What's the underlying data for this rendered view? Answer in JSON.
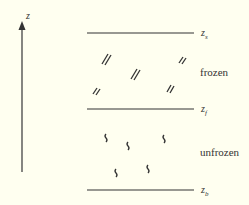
{
  "axis": {
    "label": "z"
  },
  "levels": [
    {
      "id": "zs",
      "label": "z",
      "sub": "s",
      "y": 33
    },
    {
      "id": "zf",
      "label": "z",
      "sub": "f",
      "y": 109
    },
    {
      "id": "zb",
      "label": "z",
      "sub": "b",
      "y": 190
    }
  ],
  "regions": [
    {
      "id": "frozen",
      "label": "frozen"
    },
    {
      "id": "unfrozen",
      "label": "unfrozen"
    }
  ],
  "colors": {
    "background": "#fffff0",
    "ink": "#333333"
  }
}
